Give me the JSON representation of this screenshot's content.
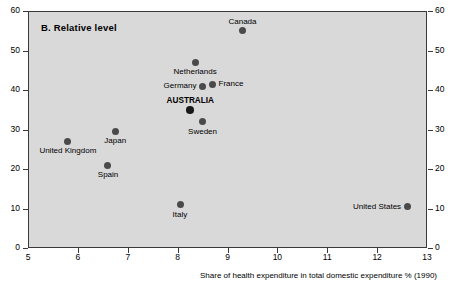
{
  "panel": {
    "label": "B.  Relative level"
  },
  "axes": {
    "x_title": "Share of health expenditure in total domestic expenditure % (1990)",
    "x_ticks": [
      "5",
      "6",
      "7",
      "8",
      "9",
      "10",
      "11",
      "12",
      "13"
    ],
    "x_tick_values": [
      5,
      6,
      7,
      8,
      9,
      10,
      11,
      12,
      13
    ],
    "y_ticks_left": [
      "60",
      "50",
      "40",
      "30",
      "20",
      "10",
      "0"
    ],
    "y_ticks_right": [
      "60",
      "50",
      "40",
      "30",
      "20",
      "10",
      "0"
    ],
    "y_tick_values": [
      60,
      50,
      40,
      30,
      20,
      10,
      0
    ],
    "xlim": [
      5,
      13
    ],
    "ylim": [
      0,
      60
    ]
  },
  "colors": {
    "plot_background": "#d9d9d9",
    "page_background": "#ffffff",
    "marker": "#4a4a4a",
    "marker_highlight": "#1a1a1a",
    "axis": "#3a3a3a",
    "text": "#000000"
  },
  "chart_data": {
    "type": "scatter",
    "title": "B.  Relative level",
    "xlabel": "Share of health expenditure in total domestic expenditure % (1990)",
    "ylabel": "",
    "xlim": [
      5,
      13
    ],
    "ylim": [
      0,
      60
    ],
    "grid": false,
    "legend": "none",
    "points": [
      {
        "name": "Canada",
        "x": 9.3,
        "y": 55.0,
        "label_pos": "above"
      },
      {
        "name": "Netherlands",
        "x": 8.35,
        "y": 47.0,
        "label_pos": "below"
      },
      {
        "name": "France",
        "x": 8.7,
        "y": 41.5,
        "label_pos": "right"
      },
      {
        "name": "Germany",
        "x": 8.5,
        "y": 41.0,
        "label_pos": "left"
      },
      {
        "name": "AUSTRALIA",
        "x": 8.25,
        "y": 35.0,
        "label_pos": "above",
        "highlight": true
      },
      {
        "name": "Sweden",
        "x": 8.5,
        "y": 32.0,
        "label_pos": "below"
      },
      {
        "name": "Japan",
        "x": 6.75,
        "y": 29.5,
        "label_pos": "below"
      },
      {
        "name": "United Kingdom",
        "x": 5.8,
        "y": 27.0,
        "label_pos": "below"
      },
      {
        "name": "Spain",
        "x": 6.6,
        "y": 21.0,
        "label_pos": "below"
      },
      {
        "name": "Italy",
        "x": 8.05,
        "y": 11.0,
        "label_pos": "below"
      },
      {
        "name": "United States",
        "x": 12.6,
        "y": 10.5,
        "label_pos": "left"
      }
    ]
  }
}
